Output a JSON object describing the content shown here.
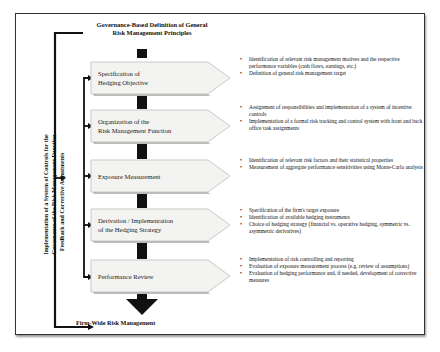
{
  "diagram": {
    "top_title": "Governance-Based Definition of General Risk Management Principles",
    "bottom_title": "Firm-Wide Risk Management",
    "outer_side_label_line1": "Implementation of a System of Controls for the",
    "outer_side_label_line2": "Governance of the Risk Management Function",
    "inner_side_label": "Feedback and Corrective Adjustments",
    "steps": [
      {
        "label_line1": "Specification of",
        "label_line2": "Hedging Objective",
        "bullets": [
          "Identification of relevant risk management motives and the respective performance variables (cash flows, earnings, etc.)",
          "Definition of general risk management target"
        ]
      },
      {
        "label_line1": "Organization of the",
        "label_line2": "Risk Management Function",
        "bullets": [
          "Assignment of responsibilities and implementation of a system of incentive controls",
          "Implementation of a formal risk tracking and control system with front and back office task assignments"
        ]
      },
      {
        "label_line1": "Exposure Measurement",
        "label_line2": "",
        "bullets": [
          "Identification of relevant risk factors and their statistical properties",
          "Measurement of aggregate performance sensitivities using Monte-Carlo analysis"
        ]
      },
      {
        "label_line1": "Derivation / Implementation",
        "label_line2": "of the Hedging Strategy",
        "bullets": [
          "Specification of the firm's target exposure",
          "Identification of available hedging instruments",
          "Choice of hedging strategy (financial vs. operative hedging, symmetric vs. asymmetric derivatives)"
        ]
      },
      {
        "label_line1": "Performance Review",
        "label_line2": "",
        "bullets": [
          "Implementation of risk controlling and reporting",
          "Evaluation of exposure measurement process (e.g. review of assumptions)",
          "Evaluation of hedging performance and, if needed, development of corrective measures"
        ]
      }
    ]
  }
}
